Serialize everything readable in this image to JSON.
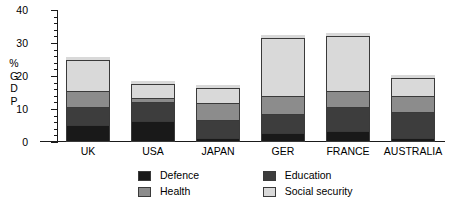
{
  "chart_data": {
    "type": "bar",
    "stacked": true,
    "title": "",
    "xlabel": "",
    "ylabel": "% GDP",
    "ylabel_chars": [
      "%",
      "G",
      "D",
      "P"
    ],
    "categories": [
      "UK",
      "USA",
      "JAPAN",
      "GER",
      "FRANCE",
      "AUSTRALIA"
    ],
    "ylim": [
      0,
      40
    ],
    "yticks": [
      0,
      10,
      20,
      30,
      40
    ],
    "ytick_labels": [
      "0",
      "10",
      "20",
      "30",
      "40"
    ],
    "minor_tick_step": 2,
    "grid": false,
    "legend_position": "bottom",
    "series": [
      {
        "name": "Defence",
        "color": "#191919",
        "values": [
          5.0,
          6.0,
          1.0,
          2.5,
          3.0,
          1.0
        ]
      },
      {
        "name": "Education",
        "color": "#3d3d3d",
        "values": [
          5.0,
          5.5,
          5.0,
          5.5,
          7.0,
          7.5
        ]
      },
      {
        "name": "Health",
        "color": "#8c8c8c",
        "values": [
          4.5,
          0.8,
          5.0,
          5.0,
          4.5,
          4.5
        ]
      },
      {
        "name": "Social security",
        "color": "#d9d9d9",
        "values": [
          10.5,
          5.2,
          5.5,
          18.5,
          17.5,
          6.5
        ]
      }
    ],
    "totals": [
      25.0,
      17.5,
      16.5,
      31.5,
      32.0,
      19.5
    ]
  },
  "legend": {
    "items": [
      {
        "label": "Defence",
        "color": "#191919"
      },
      {
        "label": "Education",
        "color": "#3d3d3d"
      },
      {
        "label": "Health",
        "color": "#8c8c8c"
      },
      {
        "label": "Social security",
        "color": "#d9d9d9"
      }
    ]
  },
  "axis": {
    "line_color": "#1a1a1a"
  }
}
